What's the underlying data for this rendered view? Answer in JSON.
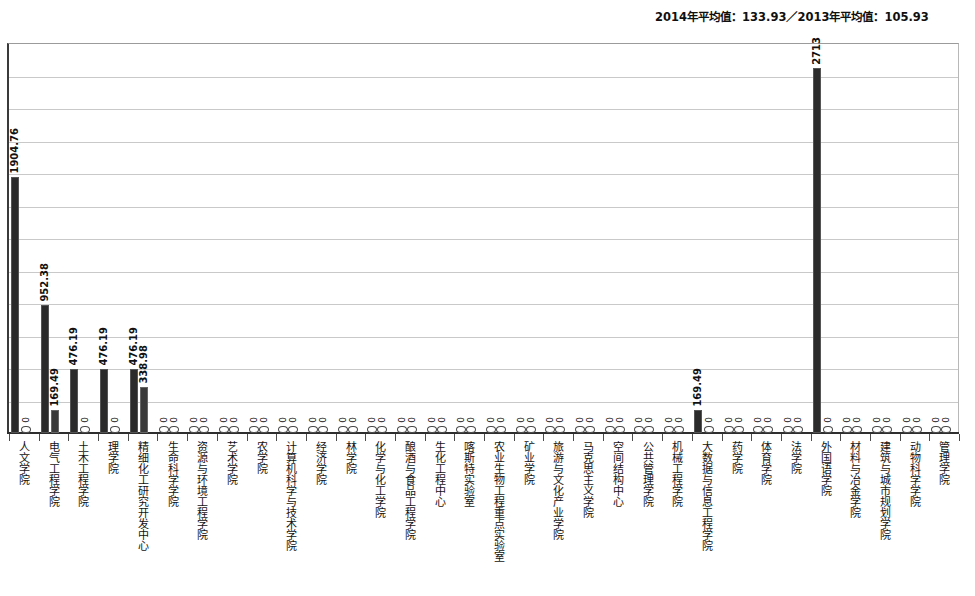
{
  "header": {
    "note": "2014年平均值：133.93／2013年平均值：105.93"
  },
  "chart_data": {
    "type": "bar",
    "title": "",
    "subtitle": "2014年平均值：133.93／2013年平均值：105.93",
    "xlabel": "",
    "ylabel": "",
    "ylim": [
      0,
      2900
    ],
    "grid": true,
    "gridline_count": 11,
    "legend_position": "none",
    "categories": [
      "人文学院",
      "电气工程学院",
      "土木工程学院",
      "理学院",
      "精细化工研究开发中心",
      "生命科学学院",
      "资源与环境工程学院",
      "艺术学院",
      "农学院",
      "计算机科学与技术学院",
      "经济学院",
      "林学院",
      "化学与化工学院",
      "酿酒与食品工程学院",
      "生化工程中心",
      "喀斯特实验室",
      "农业生物工程重点实验室",
      "矿业学院",
      "旅游与文化产业学院",
      "马克思主义学院",
      "空间结构中心",
      "公共管理学院",
      "机械工程学院",
      "大数据与信息工程学院",
      "药学院",
      "体育学院",
      "法学院",
      "外国语学院",
      "材料与冶金学院",
      "建筑与城市规划学院",
      "动物科学学院",
      "管理学院"
    ],
    "series": [
      {
        "name": "2014年",
        "values": [
          1904.76,
          952.38,
          476.19,
          476.19,
          476.19,
          0,
          0,
          0,
          0,
          0,
          0,
          0,
          0,
          0,
          0,
          0,
          0,
          0,
          0,
          0,
          0,
          0,
          0,
          169.49,
          0,
          0,
          0,
          2713,
          0,
          0,
          0,
          0
        ],
        "labels": [
          "1904.76",
          "952.38",
          "476.19",
          "476.19",
          "476.19",
          "0",
          "0",
          "0",
          "0",
          "0",
          "0",
          "0",
          "0",
          "0",
          "0",
          "0",
          "0",
          "0",
          "0",
          "0",
          "0",
          "0",
          "0",
          "169.49",
          "0",
          "0",
          "0",
          "2713",
          "0",
          "0",
          "0",
          "0"
        ]
      },
      {
        "name": "2013年",
        "values": [
          0,
          169.49,
          0,
          0,
          338.98,
          0,
          0,
          0,
          0,
          0,
          0,
          0,
          0,
          0,
          0,
          0,
          0,
          0,
          0,
          0,
          0,
          0,
          0,
          0,
          0,
          0,
          0,
          0,
          0,
          0,
          0,
          0
        ],
        "labels": [
          "0",
          "169.49",
          "0",
          "0",
          "338.98",
          "0",
          "0",
          "0",
          "0",
          "0",
          "0",
          "0",
          "0",
          "0",
          "0",
          "0",
          "0",
          "0",
          "0",
          "0",
          "0",
          "0",
          "0",
          "0",
          "0",
          "0",
          "0",
          "0",
          "0",
          "0",
          "0",
          "0"
        ]
      }
    ]
  },
  "colors": {
    "bar_2014": "#2b2b2b",
    "bar_2013": "#3a3a3a",
    "gridline": "#c9c9c9",
    "axis": "#2e2e2e",
    "text": "#131313"
  }
}
